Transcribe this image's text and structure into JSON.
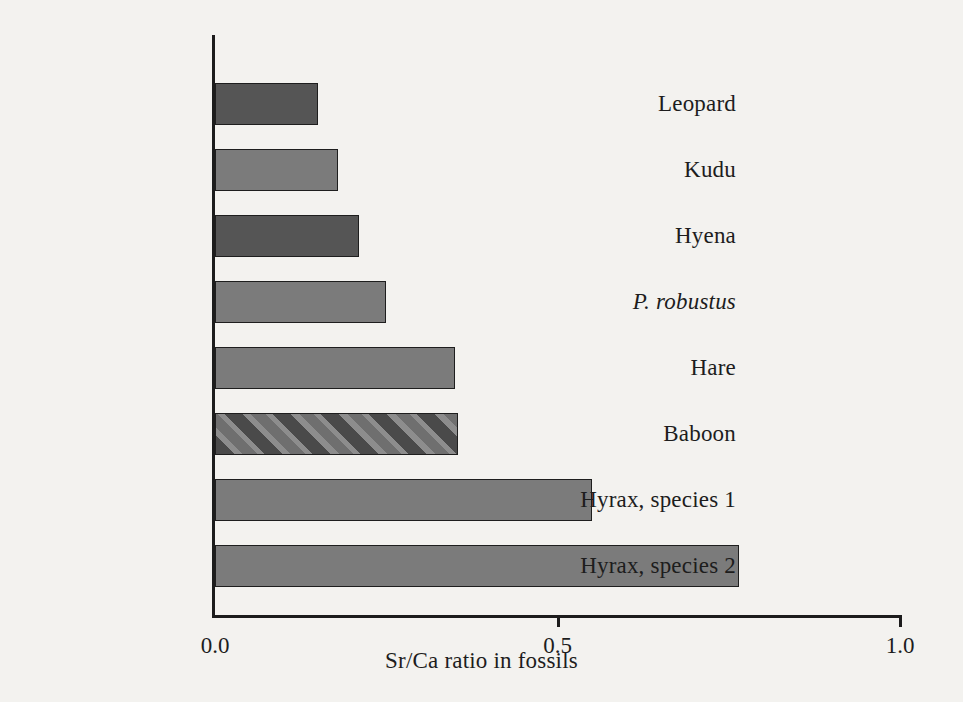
{
  "chart_data": {
    "type": "bar",
    "orientation": "horizontal",
    "title": "",
    "xlabel": "Sr/Ca ratio in fossils",
    "ylabel": "",
    "xlim": [
      0.0,
      1.0
    ],
    "ylim": null,
    "grid": false,
    "legend": null,
    "xticks": [
      "0.0",
      "0.5",
      "1.0"
    ],
    "xtick_values": [
      0.0,
      0.5,
      1.0
    ],
    "categories": [
      "Leopard",
      "Kudu",
      "Hyena",
      "P. robustus",
      "Hare",
      "Baboon",
      "Hyrax, species 1",
      "Hyrax, species 2"
    ],
    "values": [
      0.15,
      0.18,
      0.21,
      0.25,
      0.35,
      0.355,
      0.55,
      0.765
    ],
    "bars": [
      {
        "label": "Leopard",
        "value": 0.15,
        "style": "dark",
        "italic": false
      },
      {
        "label": "Kudu",
        "value": 0.18,
        "style": "light",
        "italic": false
      },
      {
        "label": "Hyena",
        "value": 0.21,
        "style": "dark",
        "italic": false
      },
      {
        "label": "P. robustus",
        "value": 0.25,
        "style": "light",
        "italic": true
      },
      {
        "label": "Hare",
        "value": 0.35,
        "style": "light",
        "italic": false
      },
      {
        "label": "Baboon",
        "value": 0.355,
        "style": "hatch",
        "italic": false
      },
      {
        "label": "Hyrax, species 1",
        "value": 0.55,
        "style": "light",
        "italic": false
      },
      {
        "label": "Hyrax, species 2",
        "value": 0.765,
        "style": "light",
        "italic": false
      }
    ],
    "colors": {
      "dark_bar": "#555555",
      "light_bar": "#7b7b7b",
      "hatch_bar": "#6f6f6f",
      "axis": "#1c1c1c",
      "background": "#f3f2ef",
      "text": "#1d1d1d"
    }
  }
}
